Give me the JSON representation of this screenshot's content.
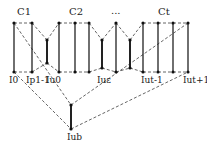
{
  "diagram": {
    "group_labels": [
      "C1",
      "C2",
      "...",
      "Ct"
    ],
    "node_labels": {
      "i0": "I0",
      "ip1": "Ip1-1",
      "iu0": "Iu0",
      "iue": "Iuε",
      "iut1": "Iut-1",
      "iut": "Iut+1",
      "iub": "Iub"
    },
    "colors": {
      "solid": "#222222",
      "dashed": "#555555",
      "node": "#111111"
    }
  }
}
